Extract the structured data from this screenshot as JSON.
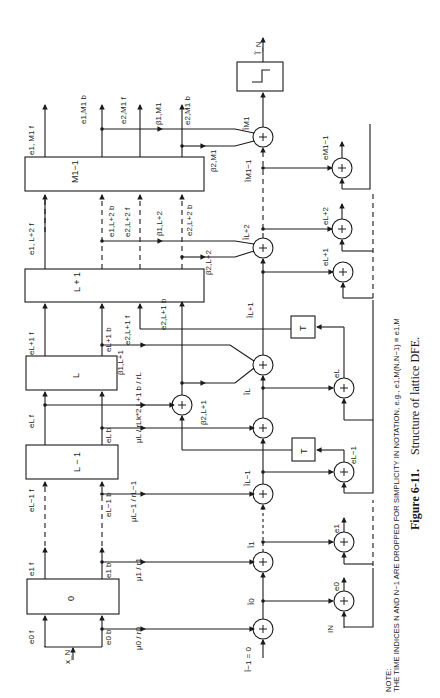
{
  "figure": {
    "number": "Figure 6-11.",
    "caption": "Structure of lattice DFE.",
    "note_title": "NOTE:",
    "note_text": "THE TIME INDICES N AND N−1 ARE DROPPED FOR SIMPLICITY IN NOTATION, e.g., e1,M(N,N−1) ≡ e1,M"
  },
  "blocks": [
    {
      "id": "stage-0",
      "label": "0"
    },
    {
      "id": "stage-L-1",
      "label": "L − 1"
    },
    {
      "id": "stage-L",
      "label": "L"
    },
    {
      "id": "stage-L+1",
      "label": "L + 1"
    },
    {
      "id": "stage-M1-1",
      "label": "M1−1"
    },
    {
      "id": "T-upper",
      "label": "T"
    },
    {
      "id": "T-lower",
      "label": "T"
    }
  ],
  "decision_device": {
    "label": "slicer",
    "output": "Ĩ_N"
  },
  "signals": {
    "input_x": "x_N",
    "e0f": "e0 f",
    "e0b": "e0 b",
    "e1f": "e1 f",
    "e1b": "e1 b",
    "eLm1f": "eL−1 f",
    "eLm1b": "eL−1 b",
    "eLf": "eL f",
    "eLb": "eL b",
    "eLp1f": "eL+1 f",
    "eLp1b": "eL+1 b",
    "e2Lp1f": "e2,L+1 f",
    "e2Lp1b": "e2,L+1 b",
    "e1Lp2f": "e1, L+2 f",
    "e1Lp2b": "e1,L+2 b",
    "e2Lp2f": "e2,L+2 f",
    "e2Lp2b": "e2,L+2 b",
    "e1M1f": "e1, M1 f",
    "e1M1b": "e1,M1 b",
    "e2M1f": "e2,M1 f",
    "e2M1b": "e2,M1 b"
  },
  "coefficients": {
    "mu0": "μ0 / r0",
    "mu1": "μ1 / r1",
    "muLm1": "μL−1 / rL−1",
    "muL": "μL / rL",
    "k2Lp1": "k*2,L+1 b / rL",
    "beta1Lp1": "β1,L+1",
    "beta2Lp1": "β2,L+1",
    "beta1Lp2": "β1,L+2",
    "beta2Lp2": "β2,L+2",
    "beta1M1": "β1,M1",
    "beta2M1": "β2,M1"
  },
  "estimates": {
    "Im1": "Î−1 = 0",
    "I0": "Î0",
    "I1": "Î1",
    "ILm1": "ÎL−1",
    "IL": "ÎL",
    "ILp1": "ÎL+1",
    "ILp2": "ÎL+2",
    "IM1m1": "ÎM1−1",
    "IM1": "ÎM1"
  },
  "errors": {
    "IN": "IN",
    "e0": "e0",
    "e1": "e1",
    "eLm1": "eL−1",
    "eL": "eL",
    "eLp1": "eL+1",
    "eLp2": "eL+2",
    "eM1m1": "eM1−1"
  },
  "signs": {
    "plus": "+",
    "minus": "−"
  }
}
